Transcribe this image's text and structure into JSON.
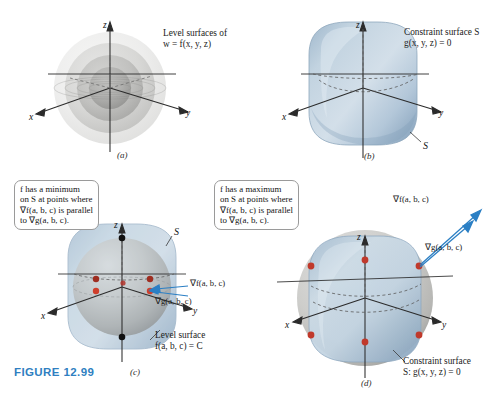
{
  "figure": {
    "number_label": "FIGURE 12.99",
    "accent_color": "#2f7fc1"
  },
  "colors": {
    "surface_blue_light": "#cddbe6",
    "surface_blue_mid": "#a9c0d4",
    "surface_blue_dark": "#7e9cb8",
    "sphere_gray_light": "#d9d9d7",
    "sphere_gray_mid": "#b8b8b5",
    "sphere_gray_dark": "#949492",
    "point_red": "#c0392b",
    "point_black": "#111111",
    "arrow_blue": "#2b7fc4",
    "axis_black": "#2b2b2b"
  },
  "panels": [
    {
      "id": "a",
      "label": "(a)",
      "caption_lines": [
        "Level surfaces of",
        "w = f(x, y, z)"
      ],
      "axes": {
        "x": "x",
        "y": "y",
        "z": "z"
      },
      "surface_type": "concentric-level-spheres",
      "shell_count": 4
    },
    {
      "id": "b",
      "label": "(b)",
      "caption_lines": [
        "Constraint surface S",
        "g(x, y, z) = 0"
      ],
      "axes": {
        "x": "x",
        "y": "y",
        "z": "z"
      },
      "surface_label": "S",
      "surface_type": "rounded-cube-constraint"
    },
    {
      "id": "c",
      "label": "(c)",
      "callout_lines": [
        "f has a minimum",
        "on S at points where",
        "∇f(a, b, c) is parallel",
        "to ∇g(a, b, c)."
      ],
      "axes": {
        "x": "x",
        "y": "y",
        "z": "z"
      },
      "surface_label": "S",
      "level_surface_lines": [
        "Level surface",
        "f(a, b, c) = C"
      ],
      "gradient_f_label": "∇f(a, b, c)",
      "gradient_g_label": "∇g(a, b, c)",
      "tangency_points_red": 6,
      "tangency_points_black": 2,
      "surface_type": "sphere-inscribed-in-rounded-cube"
    },
    {
      "id": "d",
      "label": "(d)",
      "callout_lines": [
        "f has a maximum",
        "on S at points where",
        "∇f(a, b, c) is parallel",
        "to ∇g(a, b, c)."
      ],
      "axes": {
        "x": "x",
        "y": "y",
        "z": "z"
      },
      "constraint_lines": [
        "Constraint surface",
        "S: g(x, y, z) = 0"
      ],
      "gradient_f_label": "∇f(a, b, c)",
      "gradient_g_label": "∇g(a, b, c)",
      "tangency_points_red": 8,
      "surface_type": "rounded-cube-inscribed-in-sphere"
    }
  ]
}
